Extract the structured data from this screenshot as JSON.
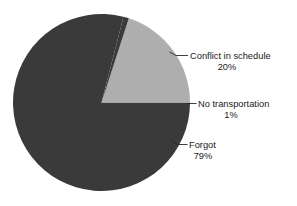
{
  "chart_data": {
    "type": "pie",
    "title": "",
    "subtitle": "",
    "xlabel": "",
    "ylabel": "",
    "legend_position": "none",
    "grid": false,
    "labels_outside": true,
    "units": "percent",
    "categories": [
      "Conflict in schedule",
      "No transportation",
      "Forgot"
    ],
    "values": [
      20,
      1,
      79
    ],
    "slices": [
      {
        "label": "Conflict in schedule",
        "value": 20,
        "value_label": "20%",
        "color": "#aeaeae",
        "start_angle_deg": 3.6,
        "end_angle_deg": 75.6
      },
      {
        "label": "No transportation",
        "value": 1,
        "value_label": "1%",
        "color": "#3a3a3a",
        "start_angle_deg": 0,
        "end_angle_deg": 3.6
      },
      {
        "label": "Forgot",
        "value": 79,
        "value_label": "79%",
        "color": "#3a3a3a",
        "start_angle_deg": 75.6,
        "end_angle_deg": 360
      }
    ]
  },
  "figure": {
    "background_color": "#ffffff",
    "dark_slice_color": "#3a3a3a",
    "light_slice_color": "#aeaeae",
    "text_color": "#1a1a1a",
    "leader_line_color": "#2b2b2b",
    "center_x": 101.5,
    "center_y": 102.5,
    "radius": 88.5
  },
  "annotations": {
    "conflict": {
      "label": "Conflict in schedule",
      "percent": "20%"
    },
    "no_transportation": {
      "label": "No transportation",
      "percent": "1%"
    },
    "forgot": {
      "label": "Forgot",
      "percent": "79%"
    }
  },
  "footnote": {
    "text": ""
  }
}
